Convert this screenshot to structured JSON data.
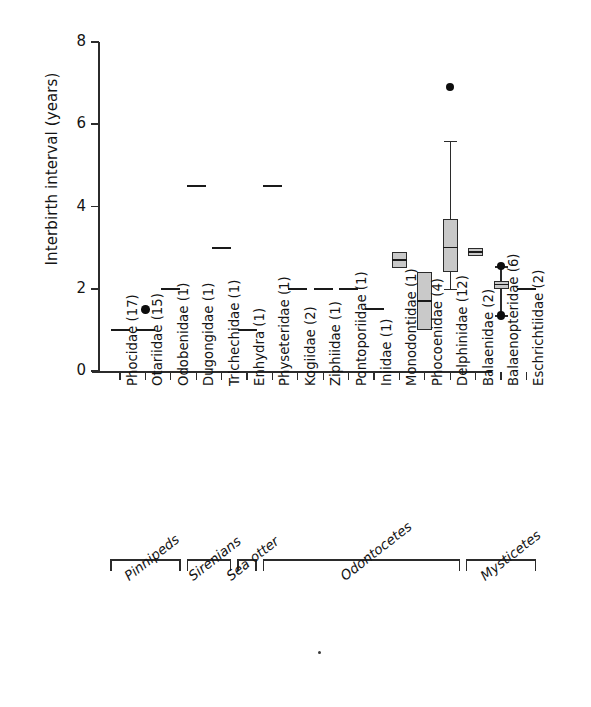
{
  "chart_data": {
    "type": "box",
    "title": "",
    "xlabel": "",
    "ylabel": "Interbirth interval (years)",
    "ylim": [
      0,
      8
    ],
    "yticks": [
      0,
      2,
      4,
      6,
      8
    ],
    "grid": false,
    "legend": null,
    "categories": [
      "Phocidae (17)",
      "Otariidae (15)",
      "Odobenidae (1)",
      "Dugongidae (1)",
      "Trichechidae (1)",
      "Enhydra (1)",
      "Physeteridae (1)",
      "Kogiidae (2)",
      "Ziphiidae (1)",
      "Pontoporiidae (1)",
      "Iniidae (1)",
      "Monodontidae (1)",
      "Phocoenidae (4)",
      "Delphinidae (12)",
      "Balaenidae (2)",
      "Balaenopteridae (6)",
      "Eschrichtiidae (2)"
    ],
    "sample_sizes": [
      17,
      15,
      1,
      1,
      1,
      1,
      1,
      2,
      1,
      1,
      1,
      1,
      4,
      12,
      2,
      6,
      2
    ],
    "boxes": [
      {
        "category": "Phocidae (17)",
        "kind": "line",
        "median": 1.0,
        "outliers": []
      },
      {
        "category": "Otariidae (15)",
        "kind": "line",
        "median": 1.0,
        "outliers": [
          1.5
        ]
      },
      {
        "category": "Odobenidae (1)",
        "kind": "line",
        "median": 2.0,
        "outliers": []
      },
      {
        "category": "Dugongidae (1)",
        "kind": "line",
        "median": 4.5,
        "outliers": []
      },
      {
        "category": "Trichechidae (1)",
        "kind": "line",
        "median": 3.0,
        "outliers": []
      },
      {
        "category": "Enhydra (1)",
        "kind": "line",
        "median": 1.0,
        "outliers": []
      },
      {
        "category": "Physeteridae (1)",
        "kind": "line",
        "median": 4.5,
        "outliers": []
      },
      {
        "category": "Kogiidae (2)",
        "kind": "line",
        "median": 2.0,
        "outliers": []
      },
      {
        "category": "Ziphiidae (1)",
        "kind": "line",
        "median": 2.0,
        "outliers": []
      },
      {
        "category": "Pontoporiidae (1)",
        "kind": "line",
        "median": 2.0,
        "outliers": []
      },
      {
        "category": "Iniidae (1)",
        "kind": "line",
        "median": 1.5,
        "outliers": []
      },
      {
        "category": "Monodontidae (1)",
        "kind": "box",
        "q1": 2.5,
        "median": 2.7,
        "q3": 2.9,
        "whisker_low": null,
        "whisker_high": null,
        "outliers": []
      },
      {
        "category": "Phocoenidae (4)",
        "kind": "box",
        "q1": 1.0,
        "median": 1.7,
        "q3": 2.4,
        "whisker_low": null,
        "whisker_high": null,
        "outliers": []
      },
      {
        "category": "Delphinidae (12)",
        "kind": "box",
        "q1": 2.4,
        "median": 3.0,
        "q3": 3.7,
        "whisker_low": 2.0,
        "whisker_high": 5.6,
        "outliers": [
          6.9
        ]
      },
      {
        "category": "Balaenidae (2)",
        "kind": "box",
        "q1": 2.8,
        "median": 2.9,
        "q3": 3.0,
        "whisker_low": null,
        "whisker_high": null,
        "outliers": []
      },
      {
        "category": "Balaenopteridae (6)",
        "kind": "box",
        "q1": 2.0,
        "median": 2.1,
        "q3": 2.2,
        "whisker_low": 1.35,
        "whisker_high": 2.55,
        "outliers": [
          2.55,
          1.35
        ]
      },
      {
        "category": "Eschrichtiidae (2)",
        "kind": "line",
        "median": 2.0,
        "outliers": []
      }
    ],
    "groups": [
      {
        "label": "Pinnipeds",
        "first": "Phocidae (17)",
        "last": "Odobenidae (1)"
      },
      {
        "label": "Sirenians",
        "first": "Dugongidae (1)",
        "last": "Trichechidae (1)"
      },
      {
        "label": "Sea otter",
        "first": "Enhydra (1)",
        "last": "Enhydra (1)"
      },
      {
        "label": "Odontocetes",
        "first": "Physeteridae (1)",
        "last": "Delphinidae (12)"
      },
      {
        "label": "Mysticetes",
        "first": "Balaenidae (2)",
        "last": "Eschrichtiidae (2)"
      }
    ]
  }
}
